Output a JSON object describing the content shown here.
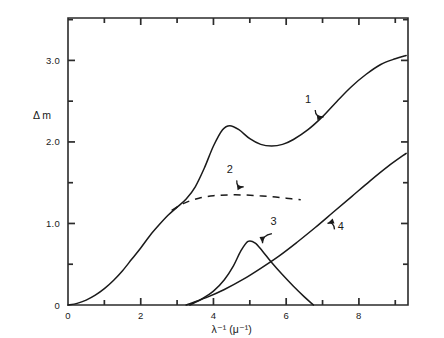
{
  "chart_data": {
    "type": "line",
    "title": "",
    "xlabel": "λ⁻¹  (μ⁻¹)",
    "ylabel": "Δ m",
    "xlim": [
      0,
      9.35
    ],
    "ylim": [
      0,
      3.52
    ],
    "grid": false,
    "legend_position": "inline-annotations",
    "x_ticks_major": [
      0,
      2,
      4,
      6,
      8
    ],
    "x_tick_labels": [
      "0",
      "2",
      "4",
      "6",
      "8"
    ],
    "x_ticks_minor": [
      1,
      3,
      5,
      7,
      9
    ],
    "y_ticks_major": [
      0,
      1.0,
      2.0,
      3.0
    ],
    "y_tick_labels": [
      "0",
      "1.0",
      "2.0",
      "3.0"
    ],
    "y_ticks_minor": [
      0.5,
      1.5,
      2.5,
      3.5
    ],
    "series": [
      {
        "name": "1",
        "style": "solid",
        "label": "1",
        "points": [
          [
            0.0,
            0.0
          ],
          [
            0.25,
            0.02
          ],
          [
            0.5,
            0.06
          ],
          [
            0.75,
            0.12
          ],
          [
            1.0,
            0.2
          ],
          [
            1.25,
            0.3
          ],
          [
            1.5,
            0.42
          ],
          [
            1.75,
            0.56
          ],
          [
            2.0,
            0.7
          ],
          [
            2.25,
            0.85
          ],
          [
            2.5,
            0.98
          ],
          [
            2.75,
            1.1
          ],
          [
            3.0,
            1.2
          ],
          [
            3.25,
            1.3
          ],
          [
            3.5,
            1.45
          ],
          [
            3.75,
            1.68
          ],
          [
            4.0,
            1.95
          ],
          [
            4.25,
            2.15
          ],
          [
            4.45,
            2.2
          ],
          [
            4.7,
            2.15
          ],
          [
            5.0,
            2.04
          ],
          [
            5.3,
            1.97
          ],
          [
            5.6,
            1.95
          ],
          [
            5.9,
            1.97
          ],
          [
            6.2,
            2.03
          ],
          [
            6.6,
            2.15
          ],
          [
            7.0,
            2.31
          ],
          [
            7.4,
            2.5
          ],
          [
            7.8,
            2.68
          ],
          [
            8.2,
            2.83
          ],
          [
            8.6,
            2.95
          ],
          [
            9.0,
            3.02
          ],
          [
            9.3,
            3.06
          ]
        ]
      },
      {
        "name": "2",
        "style": "dashed",
        "label": "2",
        "points": [
          [
            2.85,
            1.16
          ],
          [
            3.2,
            1.25
          ],
          [
            3.6,
            1.31
          ],
          [
            4.0,
            1.34
          ],
          [
            4.4,
            1.35
          ],
          [
            4.8,
            1.35
          ],
          [
            5.2,
            1.34
          ],
          [
            5.6,
            1.33
          ],
          [
            6.0,
            1.31
          ],
          [
            6.4,
            1.29
          ]
        ]
      },
      {
        "name": "3",
        "style": "solid",
        "label": "3",
        "points": [
          [
            3.35,
            0.0
          ],
          [
            3.7,
            0.08
          ],
          [
            4.0,
            0.17
          ],
          [
            4.3,
            0.31
          ],
          [
            4.55,
            0.48
          ],
          [
            4.75,
            0.66
          ],
          [
            4.95,
            0.78
          ],
          [
            5.15,
            0.76
          ],
          [
            5.35,
            0.66
          ],
          [
            5.6,
            0.52
          ],
          [
            5.9,
            0.37
          ],
          [
            6.2,
            0.23
          ],
          [
            6.5,
            0.1
          ],
          [
            6.75,
            0.0
          ]
        ]
      },
      {
        "name": "4",
        "style": "solid",
        "label": "4",
        "points": [
          [
            3.25,
            0.0
          ],
          [
            3.8,
            0.09
          ],
          [
            4.3,
            0.19
          ],
          [
            4.8,
            0.31
          ],
          [
            5.3,
            0.45
          ],
          [
            5.8,
            0.6
          ],
          [
            6.3,
            0.77
          ],
          [
            6.8,
            0.95
          ],
          [
            7.3,
            1.14
          ],
          [
            7.8,
            1.33
          ],
          [
            8.3,
            1.52
          ],
          [
            8.8,
            1.7
          ],
          [
            9.3,
            1.86
          ]
        ]
      }
    ],
    "annotations": [
      {
        "label": "1",
        "x": 6.6,
        "y": 2.48,
        "arrow_to_x": 7.1,
        "arrow_to_y": 2.28
      },
      {
        "label": "2",
        "x": 4.45,
        "y": 1.62,
        "arrow_to_x": 4.9,
        "arrow_to_y": 1.42
      },
      {
        "label": "3",
        "x": 5.65,
        "y": 0.98,
        "arrow_to_x": 5.3,
        "arrow_to_y": 0.72
      },
      {
        "label": "4",
        "x": 7.5,
        "y": 0.92,
        "arrow_to_x": 7.05,
        "arrow_to_y": 1.02
      }
    ]
  },
  "colors": {
    "axis": "#2b2b2b",
    "curve": "#1a1a1a",
    "background": "#ffffff"
  }
}
